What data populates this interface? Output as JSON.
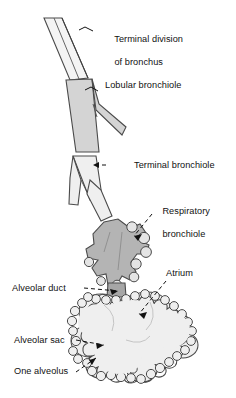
{
  "figure": {
    "background_color": "#ffffff",
    "outline_color": "#3a3a3a",
    "leader_color": "#111111",
    "text_color": "#111111"
  },
  "labels": {
    "terminal_division_line1": "Terminal division",
    "terminal_division_line2": "of bronchus",
    "lobular_bronchiole": "Lobular bronchiole",
    "terminal_bronchiole": "Terminal bronchiole",
    "respiratory_line1": "Respiratory",
    "respiratory_line2": "bronchiole",
    "alveolar_duct": "Alveolar duct",
    "atrium": "Atrium",
    "alveolar_sac": "Alveolar sac",
    "one_alveolus": "One alveolus"
  },
  "structures": [
    {
      "name": "terminal-division-of-bronchus",
      "fill": "#f2f2f2",
      "stroke": "#4a4a4a"
    },
    {
      "name": "lobular-bronchiole",
      "fill": "#d6d6d6",
      "stroke": "#4a4a4a"
    },
    {
      "name": "terminal-bronchiole",
      "fill": "#eeeeee",
      "stroke": "#4a4a4a"
    },
    {
      "name": "respiratory-bronchiole",
      "fill": "#b6b6b6",
      "stroke": "#4a4a4a"
    },
    {
      "name": "alveolar-duct",
      "fill": "#a8a8a8",
      "stroke": "#4a4a4a"
    },
    {
      "name": "alveolar-sac-cluster",
      "fill": "#efefef",
      "stroke": "#4a4a4a"
    }
  ]
}
